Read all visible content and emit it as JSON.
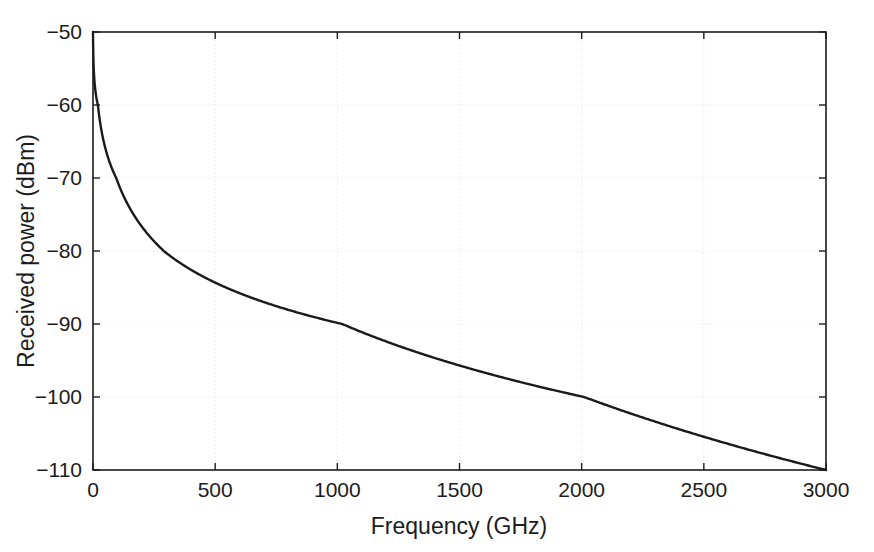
{
  "figure": {
    "background_color": "#ffffff",
    "axes_color": "#1c1c1c",
    "grid_color": "#e2e2e2",
    "line_color": "#1a1a1a"
  },
  "chart_data": {
    "type": "line",
    "title": "",
    "subtitle": "",
    "xlabel": "Frequency (GHz)",
    "ylabel": "Received power (dBm)",
    "xlim": [
      0,
      3000
    ],
    "ylim": [
      -110,
      -50
    ],
    "xticks": [
      0,
      500,
      1000,
      1500,
      2000,
      2500,
      3000
    ],
    "yticks": [
      -110,
      -100,
      -90,
      -80,
      -70,
      -60,
      -50
    ],
    "xticklabels": [
      "0",
      "500",
      "1000",
      "1500",
      "2000",
      "2500",
      "3000"
    ],
    "yticklabels": [
      "-110",
      "-100",
      "-90",
      "-80",
      "-70",
      "-60",
      "-50"
    ],
    "grid": true,
    "grid_style": "dotted",
    "legend": null,
    "legend_position": "none",
    "annotations": [],
    "series": [
      {
        "name": "Received power",
        "line_width": 2.4,
        "color": "#1a1a1a",
        "x": [
          1,
          3,
          6,
          10,
          15,
          20,
          25,
          30,
          40,
          50,
          60,
          75,
          90,
          110,
          130,
          150,
          175,
          200,
          230,
          260,
          300,
          340,
          380,
          420,
          470,
          520,
          570,
          630,
          690,
          750,
          820,
          890,
          960,
          1040,
          1120,
          1200,
          1290,
          1380,
          1470,
          1570,
          1670,
          1770,
          1880,
          1990,
          2100,
          2220,
          2340,
          2460,
          2590,
          2720,
          2860,
          3000
        ],
        "y": [
          -50.0,
          -53.6,
          -56.4,
          -58.6,
          -60.7,
          -62.2,
          -63.4,
          -64.4,
          -66.0,
          -67.2,
          -68.2,
          -69.4,
          -70.4,
          -71.6,
          -72.6,
          -73.5,
          -74.5,
          -75.3,
          -76.2,
          -77.0,
          -78.0,
          -78.9,
          -79.7,
          -80.4,
          -81.2,
          -81.9,
          -82.6,
          -83.4,
          -84.1,
          -84.8,
          -85.5,
          -86.2,
          -86.8,
          -87.5,
          -88.2,
          -88.8,
          -89.5,
          -90.2,
          -90.8,
          -91.5,
          -92.2,
          -92.8,
          -93.5,
          -94.1,
          -94.8,
          -95.5,
          -96.1,
          -96.8,
          -97.5,
          -98.1,
          -98.8,
          -110.0
        ]
      }
    ],
    "curve_reference_points": [
      {
        "x": 0,
        "y": -50.0
      },
      {
        "x": 20,
        "y": -60.0
      },
      {
        "x": 95,
        "y": -70.0
      },
      {
        "x": 290,
        "y": -80.0
      },
      {
        "x": 1020,
        "y": -90.0
      },
      {
        "x": 2010,
        "y": -100.0
      },
      {
        "x": 3000,
        "y": -110.0
      }
    ]
  }
}
